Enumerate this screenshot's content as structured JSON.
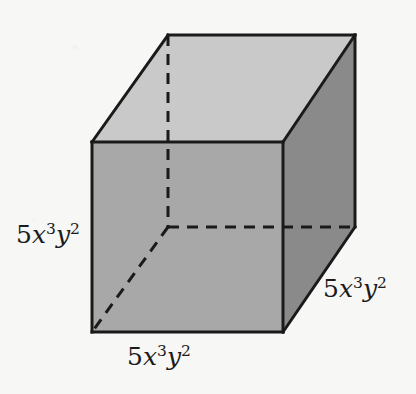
{
  "figure": {
    "kind": "cube-net-solid",
    "background_color": "#f7f7f5"
  },
  "faces": {
    "top": {
      "name": "top-face",
      "fill": "#c9c9c9"
    },
    "front": {
      "name": "front-face",
      "fill": "#a8a8a8"
    },
    "right": {
      "name": "right-face",
      "fill": "#8a8a8a"
    }
  },
  "stroke": {
    "color": "#1a1a1a",
    "solid_width": 3,
    "dashed_width": 3,
    "dash_pattern": "11 8"
  },
  "vertices": {
    "front_top_left": [
      92,
      142
    ],
    "front_top_right": [
      283,
      142
    ],
    "front_bottom_right": [
      283,
      332
    ],
    "front_bottom_left": [
      92,
      332
    ],
    "back_top_left": [
      168,
      35
    ],
    "back_top_right": [
      355,
      35
    ],
    "back_bottom_right": [
      355,
      227
    ],
    "back_bottom_left": [
      168,
      227
    ]
  },
  "labels": {
    "height": {
      "name": "height-label",
      "coefficient": "5",
      "base1": "x",
      "exp1": "3",
      "base2": "y",
      "exp2": "2",
      "plain": "5x3y2"
    },
    "width": {
      "name": "width-label",
      "coefficient": "5",
      "base1": "x",
      "exp1": "3",
      "base2": "y",
      "exp2": "2",
      "plain": "5x3y2"
    },
    "depth": {
      "name": "depth-label",
      "coefficient": "5",
      "base1": "x",
      "exp1": "3",
      "base2": "y",
      "exp2": "2",
      "plain": "5x3y2"
    }
  },
  "page_artifacts": {
    "top_left": "",
    "bottom_left": "",
    "bottom_right": "",
    "right_middle": ""
  }
}
